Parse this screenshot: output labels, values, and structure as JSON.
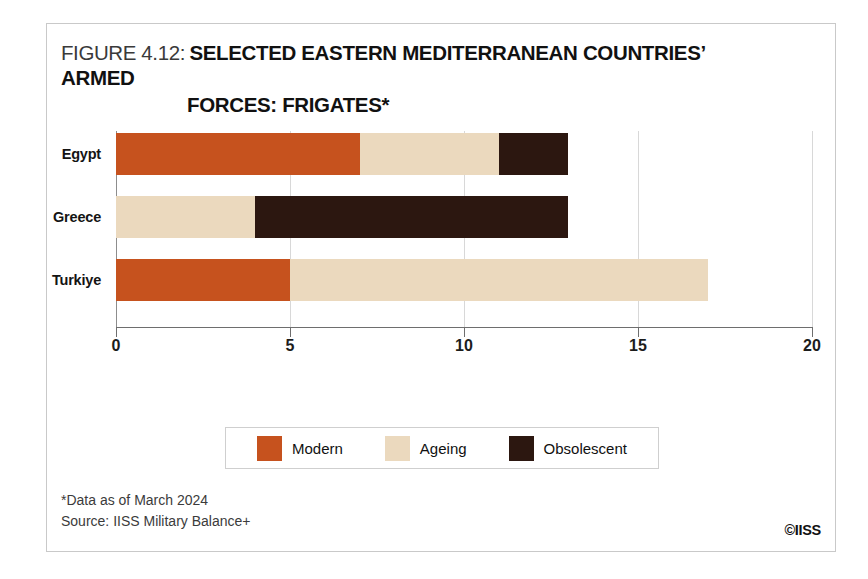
{
  "figure": {
    "title_prefix": "FIGURE 4.12:",
    "title_main_line1": "SELECTED EASTERN MEDITERRANEAN COUNTRIES’ ARMED",
    "title_main_line2": "FORCES: FRIGATES*"
  },
  "footer": {
    "note": "*Data as of March 2024",
    "source": "Source: IISS Military Balance+",
    "copyright": "©IISS"
  },
  "colors": {
    "modern": "#C6521E",
    "ageing": "#EBD9BE",
    "obsolescent": "#2C1710",
    "axis": "#6E6E6E",
    "gridline": "#D8D8D8",
    "frame": "#C9C9C9",
    "text": "#111111"
  },
  "chart_data": {
    "type": "bar",
    "orientation": "horizontal",
    "stacked": true,
    "title": "FIGURE 4.12: SELECTED EASTERN MEDITERRANEAN COUNTRIES’ ARMED FORCES: FRIGATES*",
    "xlabel": "",
    "ylabel": "",
    "xlim": [
      0,
      20
    ],
    "xticks": [
      0,
      5,
      10,
      15,
      20
    ],
    "xtick_labels": [
      "0",
      "5",
      "10",
      "15",
      "20"
    ],
    "grid": true,
    "grid_axis": "x",
    "legend_position": "bottom",
    "categories": [
      "Egypt",
      "Greece",
      "Turkiye"
    ],
    "series": [
      {
        "name": "Modern",
        "color": "#C6521E",
        "values": [
          7,
          0,
          5
        ]
      },
      {
        "name": "Ageing",
        "color": "#EBD9BE",
        "values": [
          4,
          4,
          12
        ]
      },
      {
        "name": "Obsolescent",
        "color": "#2C1710",
        "values": [
          2,
          9,
          0
        ]
      }
    ],
    "totals": [
      13,
      13,
      17
    ]
  }
}
